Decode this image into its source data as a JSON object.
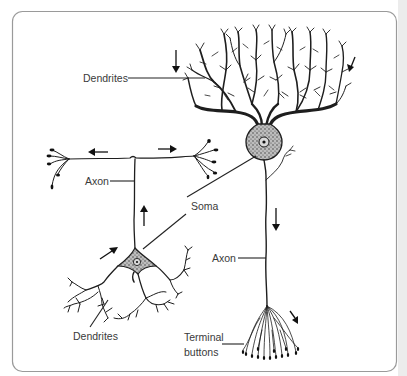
{
  "diagram": {
    "type": "neuron-structure-illustration",
    "labels": {
      "dendrites_top": "Dendrites",
      "axon_left": "Axon",
      "soma": "Soma",
      "axon_right": "Axon",
      "dendrites_bottom": "Dendrites",
      "terminal_line1": "Terminal",
      "terminal_line2": "buttons"
    },
    "neurons": [
      {
        "name": "pyramidal-like neuron (right)",
        "parts": [
          "Dendrites",
          "Soma",
          "Axon",
          "Terminal buttons"
        ]
      },
      {
        "name": "multipolar neuron (left)",
        "parts": [
          "Dendrites",
          "Soma",
          "Axon"
        ]
      }
    ],
    "signal_arrows": [
      {
        "location": "top dendrites left",
        "direction": "down"
      },
      {
        "location": "top dendrites right",
        "direction": "down-left"
      },
      {
        "location": "left axon branch",
        "direction": "left"
      },
      {
        "location": "right axon branch",
        "direction": "right"
      },
      {
        "location": "left vertical axon",
        "direction": "up"
      },
      {
        "location": "left dendrites",
        "direction": "up-right"
      },
      {
        "location": "right axon",
        "direction": "down"
      },
      {
        "location": "terminal buttons",
        "direction": "down-right"
      }
    ],
    "colors": {
      "ink": "#1e1e1e",
      "soma_fill": "#b9b9b9",
      "frame": "#9a9a9a",
      "label": "#3a3a3a",
      "side_strip": "#ececec"
    }
  }
}
